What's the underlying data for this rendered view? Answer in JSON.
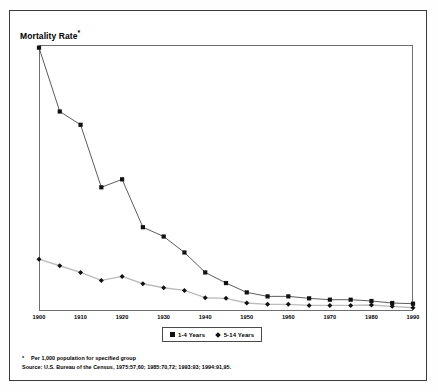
{
  "chart_data": {
    "type": "line",
    "title": "Mortality Rate*",
    "xlabel": "",
    "ylabel": "",
    "xlim": [
      1900,
      1990
    ],
    "ylim": [
      0,
      20
    ],
    "ytick_step": 1,
    "xtick_step": 10,
    "grid": false,
    "legend_position": "bottom-center",
    "x": [
      1900,
      1905,
      1910,
      1915,
      1920,
      1925,
      1930,
      1935,
      1940,
      1945,
      1950,
      1955,
      1960,
      1965,
      1970,
      1975,
      1980,
      1985,
      1990
    ],
    "xtick_labels": [
      "1900",
      "1910",
      "1920",
      "1930",
      "1940",
      "1950",
      "1960",
      "1970",
      "1980",
      "1990"
    ],
    "ytick_labels": [
      "20",
      "19",
      "18",
      "17",
      "16",
      "15",
      "14",
      "13",
      "12",
      "11",
      "10",
      "9",
      "8",
      "7",
      "6",
      "5",
      "4",
      "3",
      "2",
      "1",
      "0"
    ],
    "series": [
      {
        "name": "1-4 Years",
        "marker": "square",
        "color": "#111111",
        "line_color": "#4a4a4a",
        "values": [
          19.8,
          15.0,
          14.0,
          9.3,
          9.9,
          6.3,
          5.6,
          4.4,
          2.9,
          2.1,
          1.4,
          1.1,
          1.1,
          0.95,
          0.85,
          0.85,
          0.75,
          0.6,
          0.55
        ]
      },
      {
        "name": "5-14 Years",
        "marker": "diamond",
        "color": "#111111",
        "line_color": "#bcbcbc",
        "values": [
          3.9,
          3.4,
          2.9,
          2.3,
          2.6,
          2.05,
          1.75,
          1.55,
          1.0,
          0.95,
          0.6,
          0.5,
          0.5,
          0.42,
          0.42,
          0.42,
          0.45,
          0.35,
          0.25
        ]
      }
    ]
  },
  "legend": {
    "items": [
      {
        "label": "1-4 Years",
        "marker": "square"
      },
      {
        "label": "5-14 Years",
        "marker": "diamond"
      }
    ]
  },
  "footnotes": {
    "star_symbol": "*",
    "note": "Per 1,000 population for specified group",
    "source": "Source:  U.S. Bureau of the Census, 1975:57,60; 1985:70,72; 1993:93; 1994:91,95."
  }
}
